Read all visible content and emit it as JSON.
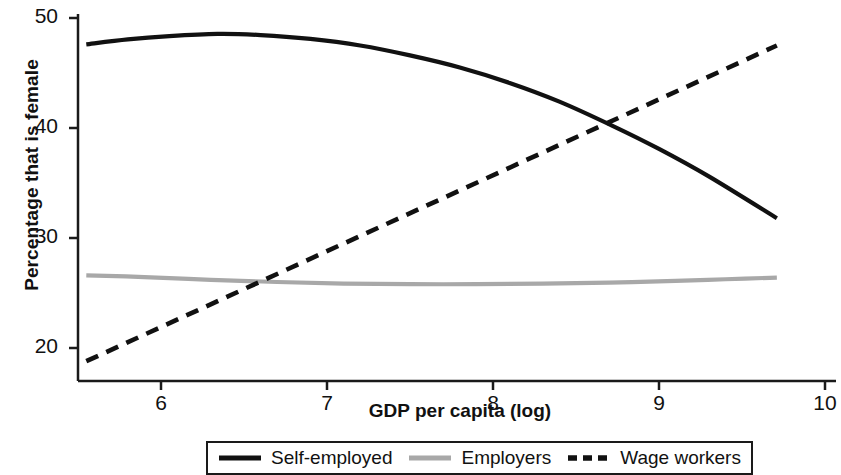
{
  "chart_data": {
    "type": "line",
    "title": "",
    "xlabel": "GDP per capita (log)",
    "ylabel": "Percentage that is female",
    "xlim": [
      5.55,
      10.0
    ],
    "ylim": [
      17.5,
      50.7
    ],
    "xticks": [
      6,
      7,
      8,
      9,
      10
    ],
    "xtick_labels": [
      "6",
      "7",
      "8",
      "9",
      "10"
    ],
    "yticks": [
      20,
      30,
      40,
      50
    ],
    "ytick_labels": [
      "20",
      "30",
      "40",
      "50"
    ],
    "grid": false,
    "legend_position": "bottom-center",
    "series": [
      {
        "name": "Self-employed",
        "style": "solid",
        "color": "#111111",
        "width": 4.2,
        "x": [
          5.55,
          5.8,
          6.05,
          6.34,
          6.6,
          6.9,
          7.2,
          7.5,
          7.8,
          8.1,
          8.4,
          8.72,
          9.0,
          9.3,
          9.71
        ],
        "y": [
          47.6,
          48.05,
          48.35,
          48.55,
          48.45,
          48.1,
          47.5,
          46.6,
          45.5,
          44.1,
          42.4,
          40.2,
          38.1,
          35.6,
          31.8
        ]
      },
      {
        "name": "Employers",
        "style": "solid",
        "color": "#a8a8a8",
        "width": 4.2,
        "x": [
          5.55,
          5.9,
          6.3,
          6.7,
          7.1,
          7.5,
          7.9,
          8.3,
          8.7,
          9.1,
          9.4,
          9.71
        ],
        "y": [
          26.6,
          26.45,
          26.2,
          26.0,
          25.85,
          25.8,
          25.8,
          25.85,
          25.95,
          26.1,
          26.25,
          26.4
        ]
      },
      {
        "name": "Wage workers",
        "style": "dashed",
        "color": "#111111",
        "width": 4.6,
        "x": [
          5.55,
          9.71
        ],
        "y": [
          18.8,
          47.5
        ]
      }
    ],
    "annotations": [
      {
        "label": "crossing self-employed / wage workers",
        "x": 8.72,
        "y": 40.2
      }
    ]
  },
  "legend": {
    "items": [
      {
        "label": "Self-employed",
        "marker": "solid-line-black"
      },
      {
        "label": "Employers",
        "marker": "solid-line-gray"
      },
      {
        "label": "Wage workers",
        "marker": "dashed-line-black"
      }
    ]
  },
  "axes": {
    "x_title": "GDP per capita (log)",
    "y_title": "Percentage that is female"
  }
}
